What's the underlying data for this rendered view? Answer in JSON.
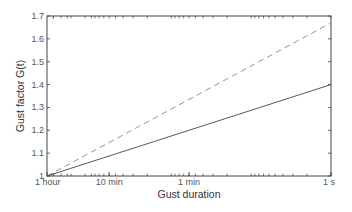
{
  "chart_data": {
    "type": "line",
    "title": "",
    "xlabel": "Gust duration",
    "ylabel": "Gust factor G(t)",
    "x_scale": "log (reversed duration)",
    "x_ticks": [
      "1 hour",
      "10 min",
      "1 min",
      "1 s"
    ],
    "x_tick_seconds": [
      3600,
      600,
      60,
      1
    ],
    "y_ticks": [
      "1",
      "1.1",
      "1.2",
      "1.3",
      "1.4",
      "1.5",
      "1.6",
      "1.7"
    ],
    "ylim": [
      1.0,
      1.7
    ],
    "grid": false,
    "legend": null,
    "series": [
      {
        "name": "dashed",
        "style": "dashed",
        "color": "#888888",
        "x": [
          "1 hour",
          "1 s"
        ],
        "values": [
          1.0,
          1.67
        ]
      },
      {
        "name": "solid",
        "style": "solid",
        "color": "#444444",
        "x": [
          "1 hour",
          "1 s"
        ],
        "values": [
          1.0,
          1.4
        ]
      }
    ]
  }
}
